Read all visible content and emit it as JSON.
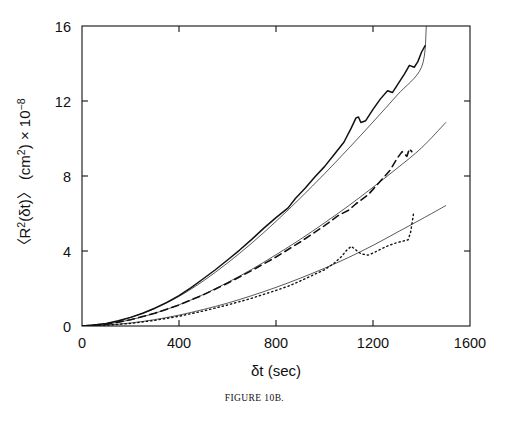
{
  "figure": {
    "caption": "FIGURE 10B."
  },
  "chart_data": {
    "type": "line",
    "title": "",
    "xlabel": "δt  (sec)",
    "ylabel": "〈R²(δt)〉 (cm²) × 10⁻⁸",
    "ylabel_parts": {
      "main": "〈R",
      "sup1": "2",
      "mid": "(δt)〉 (cm",
      "sup2": "2",
      "tail": ") × 10",
      "sup3": "−8"
    },
    "xlim": [
      0,
      1600
    ],
    "ylim": [
      0,
      16
    ],
    "xticks": [
      0,
      400,
      800,
      1200,
      1600
    ],
    "yticks": [
      0,
      4,
      8,
      12,
      16
    ],
    "xticklabels": [
      "0",
      "400",
      "800",
      "1200",
      "1600"
    ],
    "yticklabels": [
      "0",
      "4",
      "8",
      "12",
      "16"
    ],
    "grid": false,
    "legend": "none",
    "tick_direction": "in",
    "frame": "box",
    "line_color": "#111111",
    "series": [
      {
        "name": "upper-data",
        "style": "solid",
        "role": "data",
        "width": 1.5,
        "points": [
          [
            0,
            0.0
          ],
          [
            50,
            0.05
          ],
          [
            100,
            0.14
          ],
          [
            150,
            0.28
          ],
          [
            200,
            0.46
          ],
          [
            250,
            0.68
          ],
          [
            300,
            0.95
          ],
          [
            350,
            1.26
          ],
          [
            400,
            1.62
          ],
          [
            450,
            2.05
          ],
          [
            500,
            2.52
          ],
          [
            550,
            3.0
          ],
          [
            600,
            3.52
          ],
          [
            650,
            4.05
          ],
          [
            700,
            4.62
          ],
          [
            750,
            5.22
          ],
          [
            800,
            5.78
          ],
          [
            850,
            6.3
          ],
          [
            880,
            6.8
          ],
          [
            920,
            7.35
          ],
          [
            960,
            7.95
          ],
          [
            1000,
            8.5
          ],
          [
            1040,
            9.15
          ],
          [
            1080,
            9.8
          ],
          [
            1110,
            10.55
          ],
          [
            1130,
            11.1
          ],
          [
            1140,
            11.15
          ],
          [
            1150,
            10.85
          ],
          [
            1170,
            10.95
          ],
          [
            1200,
            11.55
          ],
          [
            1230,
            12.1
          ],
          [
            1260,
            12.55
          ],
          [
            1280,
            12.45
          ],
          [
            1300,
            12.85
          ],
          [
            1330,
            13.45
          ],
          [
            1350,
            13.9
          ],
          [
            1370,
            13.8
          ],
          [
            1385,
            14.1
          ],
          [
            1400,
            14.6
          ],
          [
            1415,
            14.95
          ]
        ]
      },
      {
        "name": "upper-fit",
        "style": "solid",
        "role": "fit",
        "width": 0.7,
        "points": [
          [
            0,
            0.0
          ],
          [
            100,
            0.13
          ],
          [
            200,
            0.45
          ],
          [
            300,
            0.93
          ],
          [
            400,
            1.58
          ],
          [
            500,
            2.4
          ],
          [
            600,
            3.36
          ],
          [
            700,
            4.42
          ],
          [
            800,
            5.58
          ],
          [
            900,
            6.82
          ],
          [
            1000,
            8.12
          ],
          [
            1100,
            9.48
          ],
          [
            1200,
            10.88
          ],
          [
            1300,
            12.32
          ],
          [
            1400,
            13.8
          ],
          [
            1420,
            16.0
          ]
        ]
      },
      {
        "name": "middle-data",
        "style": "dashed",
        "role": "data",
        "width": 1.6,
        "points": [
          [
            0,
            0.0
          ],
          [
            100,
            0.1
          ],
          [
            200,
            0.33
          ],
          [
            300,
            0.68
          ],
          [
            400,
            1.12
          ],
          [
            500,
            1.66
          ],
          [
            600,
            2.28
          ],
          [
            700,
            2.96
          ],
          [
            800,
            3.68
          ],
          [
            900,
            4.48
          ],
          [
            1000,
            5.35
          ],
          [
            1060,
            5.92
          ],
          [
            1100,
            6.18
          ],
          [
            1130,
            6.52
          ],
          [
            1180,
            7.0
          ],
          [
            1230,
            7.72
          ],
          [
            1270,
            8.3
          ],
          [
            1300,
            8.95
          ],
          [
            1320,
            9.3
          ],
          [
            1340,
            9.05
          ],
          [
            1350,
            9.45
          ],
          [
            1360,
            9.3
          ]
        ]
      },
      {
        "name": "middle-fit",
        "style": "solid",
        "role": "fit",
        "width": 0.7,
        "points": [
          [
            0,
            0.0
          ],
          [
            100,
            0.1
          ],
          [
            200,
            0.33
          ],
          [
            300,
            0.68
          ],
          [
            400,
            1.13
          ],
          [
            500,
            1.68
          ],
          [
            600,
            2.32
          ],
          [
            700,
            3.02
          ],
          [
            800,
            3.8
          ],
          [
            900,
            4.62
          ],
          [
            1000,
            5.5
          ],
          [
            1100,
            6.42
          ],
          [
            1200,
            7.4
          ],
          [
            1300,
            8.42
          ],
          [
            1400,
            9.5
          ],
          [
            1500,
            10.85
          ]
        ]
      },
      {
        "name": "lower-data",
        "style": "dotted",
        "role": "data",
        "width": 1.4,
        "points": [
          [
            0,
            0.0
          ],
          [
            100,
            0.04
          ],
          [
            200,
            0.14
          ],
          [
            300,
            0.3
          ],
          [
            400,
            0.52
          ],
          [
            500,
            0.8
          ],
          [
            600,
            1.12
          ],
          [
            700,
            1.48
          ],
          [
            800,
            1.9
          ],
          [
            850,
            2.12
          ],
          [
            900,
            2.4
          ],
          [
            950,
            2.7
          ],
          [
            1000,
            3.0
          ],
          [
            1040,
            3.35
          ],
          [
            1070,
            3.7
          ],
          [
            1090,
            4.02
          ],
          [
            1110,
            4.25
          ],
          [
            1130,
            4.05
          ],
          [
            1150,
            3.85
          ],
          [
            1180,
            3.78
          ],
          [
            1210,
            3.95
          ],
          [
            1240,
            4.15
          ],
          [
            1270,
            4.32
          ],
          [
            1300,
            4.45
          ],
          [
            1330,
            4.55
          ],
          [
            1345,
            4.6
          ],
          [
            1355,
            5.0
          ],
          [
            1360,
            5.4
          ],
          [
            1365,
            5.8
          ],
          [
            1368,
            6.1
          ]
        ]
      },
      {
        "name": "lower-fit",
        "style": "solid",
        "role": "fit",
        "width": 0.7,
        "points": [
          [
            0,
            0.0
          ],
          [
            100,
            0.05
          ],
          [
            200,
            0.16
          ],
          [
            300,
            0.34
          ],
          [
            400,
            0.58
          ],
          [
            500,
            0.88
          ],
          [
            600,
            1.22
          ],
          [
            700,
            1.62
          ],
          [
            800,
            2.06
          ],
          [
            900,
            2.55
          ],
          [
            1000,
            3.08
          ],
          [
            1100,
            3.66
          ],
          [
            1200,
            4.3
          ],
          [
            1300,
            5.0
          ],
          [
            1400,
            5.7
          ],
          [
            1500,
            6.42
          ]
        ]
      }
    ]
  }
}
